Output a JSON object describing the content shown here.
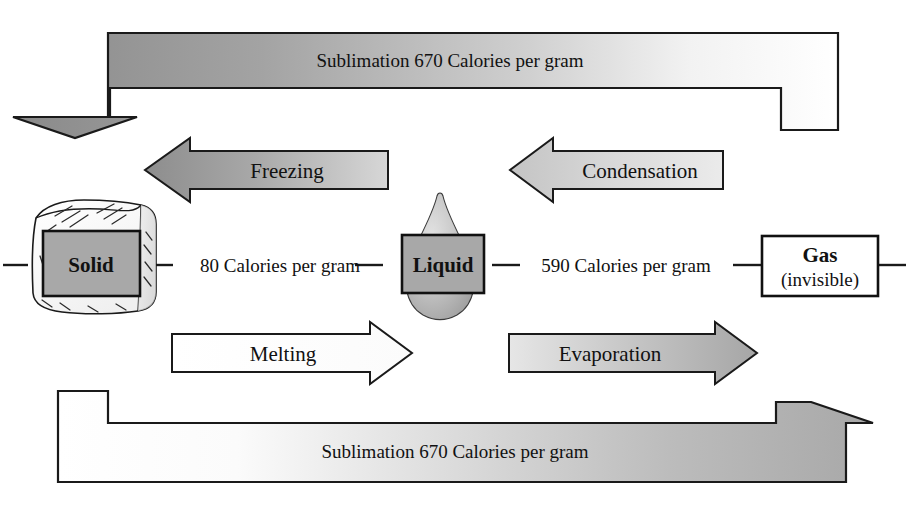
{
  "diagram": {
    "states": [
      {
        "id": "solid",
        "label": "Solid",
        "sublabel": "",
        "icon": "ice-cube-icon"
      },
      {
        "id": "liquid",
        "label": "Liquid",
        "sublabel": "",
        "icon": "water-droplet-icon"
      },
      {
        "id": "gas",
        "label": "Gas",
        "sublabel": "(invisible)",
        "icon": "gas-box-icon"
      }
    ],
    "connectors": [
      {
        "id": "solid-liquid",
        "label": "80 Calories per gram",
        "value": 80,
        "unit": "Calories per gram"
      },
      {
        "id": "liquid-gas",
        "label": "590 Calories per gram",
        "value": 590,
        "unit": "Calories per gram"
      }
    ],
    "transitions": [
      {
        "id": "freezing",
        "label": "Freezing",
        "direction": "left",
        "from": "liquid",
        "to": "solid"
      },
      {
        "id": "condensation",
        "label": "Condensation",
        "direction": "left",
        "from": "gas",
        "to": "liquid"
      },
      {
        "id": "melting",
        "label": "Melting",
        "direction": "right",
        "from": "solid",
        "to": "liquid"
      },
      {
        "id": "evaporation",
        "label": "Evaporation",
        "direction": "right",
        "from": "liquid",
        "to": "gas"
      },
      {
        "id": "sublimation-top",
        "label": "Sublimation 670 Calories per gram",
        "value": 670,
        "unit": "Calories per gram",
        "direction": "down-left",
        "from": "gas",
        "to": "solid"
      },
      {
        "id": "sublimation-bottom",
        "label": "Sublimation 670 Calories per gram",
        "value": 670,
        "unit": "Calories per gram",
        "direction": "up-right",
        "from": "solid",
        "to": "gas"
      }
    ],
    "colors": {
      "outline": "#1a1a1a",
      "text": "#111111",
      "gray_dark": "#8f8f8f",
      "gray_mid": "#b5b5b5",
      "gray_light": "#d8d8d8",
      "white": "#ffffff",
      "state_box_fill": "#a8a8a8"
    }
  }
}
